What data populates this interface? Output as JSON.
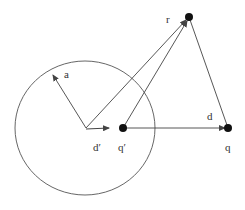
{
  "diagram": {
    "labels": {
      "r": "r",
      "a": "a",
      "d": "d",
      "d_prime": "d′",
      "q_prime": "q′",
      "q": "q"
    },
    "colors": {
      "stroke": "#444444",
      "point": "#111111",
      "background": "#ffffff"
    }
  }
}
